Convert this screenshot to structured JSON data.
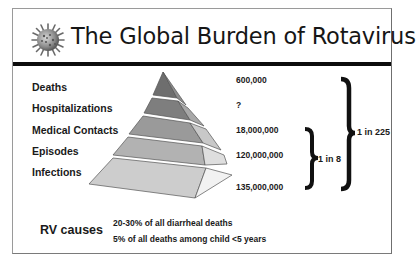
{
  "slide": {
    "title": "The Global Burden of Rotavirus",
    "icon": "virus-icon",
    "pyramid": {
      "levels": [
        {
          "label": "Deaths",
          "value": "600,000",
          "color": "#6e6e6e"
        },
        {
          "label": "Hospitalizations",
          "value": "?",
          "color": "#7e7e7e"
        },
        {
          "label": "Medical Contacts",
          "value": "18,000,000",
          "color": "#9a9a9a"
        },
        {
          "label": "Episodes",
          "value": "120,000,000",
          "color": "#b2b2b2"
        },
        {
          "label": "Infections",
          "value": "135,000,000",
          "color": "#cdcdcd"
        }
      ]
    },
    "ratios": {
      "small": "1 in 8",
      "large": "1 in 225"
    },
    "rv_causes": {
      "heading": "RV causes",
      "facts": [
        "20-30% of all diarrheal deaths",
        "5% of all deaths among child <5 years"
      ]
    }
  }
}
